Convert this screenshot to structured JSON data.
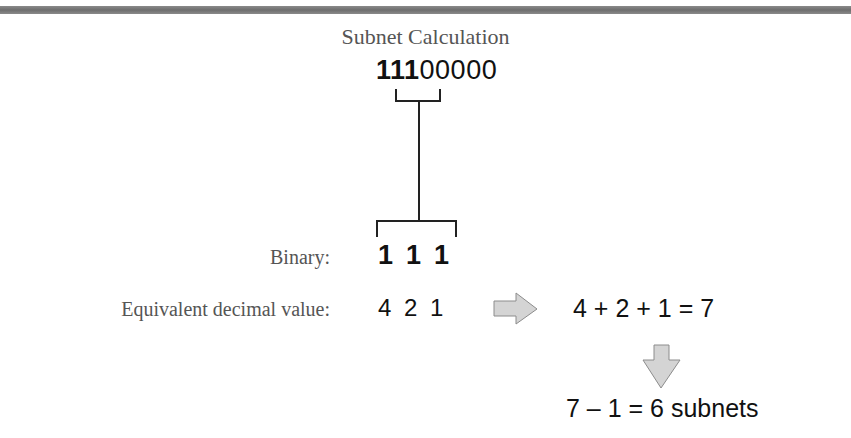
{
  "title": "Subnet Calculation",
  "mask_octet": {
    "borrowed_bits": "111",
    "remaining_bits": "00000"
  },
  "rows": {
    "binary_label": "Binary:",
    "binary_bits": [
      "1",
      "1",
      "1"
    ],
    "decimal_label": "Equivalent decimal value:",
    "decimal_values": [
      "4",
      "2",
      "1"
    ]
  },
  "sum_expression": "4 + 2 + 1 = 7",
  "result_expression": "7 – 1 = 6 subnets",
  "icons": {
    "right_arrow": "arrow-right-icon",
    "down_arrow": "arrow-down-icon"
  },
  "colors": {
    "arrow_fill": "#d4d4d4",
    "arrow_stroke": "#8c8c8c",
    "label_text": "#555555",
    "value_text": "#111111",
    "top_bar": "#7a7a7a"
  }
}
